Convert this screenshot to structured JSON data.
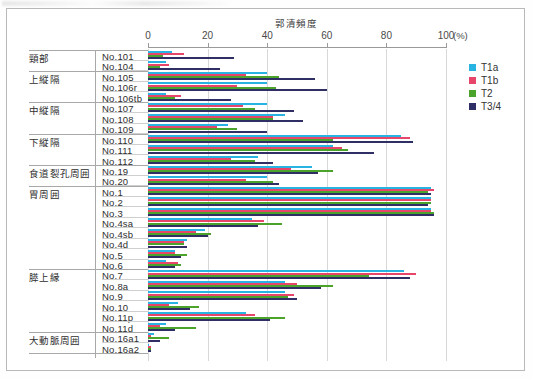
{
  "figure": {
    "axis_title": "郭清頻度",
    "percent_unit": "(%)",
    "tick_labels": [
      "0",
      "20",
      "40",
      "60",
      "80",
      "100"
    ],
    "tick_values": [
      0,
      20,
      40,
      60,
      80,
      100
    ]
  },
  "legend": {
    "position": "right",
    "entries": [
      {
        "label": "T1a",
        "color": "#29b3e3"
      },
      {
        "label": "T1b",
        "color": "#e8456b"
      },
      {
        "label": "T2",
        "color": "#4aa32a"
      },
      {
        "label": "T3/4",
        "color": "#2f2f66"
      }
    ]
  },
  "groups": [
    {
      "name": "頸部",
      "nodes": [
        "No.101",
        "No.104"
      ]
    },
    {
      "name": "上縦隔",
      "nodes": [
        "No.105",
        "No.106r",
        "No.106tb"
      ]
    },
    {
      "name": "中縦隔",
      "nodes": [
        "No.107",
        "No.108",
        "No.109"
      ]
    },
    {
      "name": "下縦隔",
      "nodes": [
        "No.110",
        "No.111",
        "No.112"
      ]
    },
    {
      "name": "食道裂孔周囲",
      "nodes": [
        "No.19",
        "No.20"
      ]
    },
    {
      "name": "胃周囲",
      "nodes": [
        "No.1",
        "No.2",
        "No.3",
        "No.4sa",
        "No.4sb",
        "No.4d",
        "No.5",
        "No.6"
      ]
    },
    {
      "name": "膵上縁",
      "nodes": [
        "No.7",
        "No.8a",
        "No.9",
        "No.10",
        "No.11p",
        "No.11d"
      ]
    },
    {
      "name": "大動脈周囲",
      "nodes": [
        "No.16a1",
        "No.16a2"
      ]
    }
  ],
  "chart_data": {
    "type": "bar",
    "orientation": "horizontal",
    "title": "郭清頻度",
    "xlabel": "郭清頻度 (%)",
    "ylabel": "",
    "xlim": [
      0,
      100
    ],
    "grid": true,
    "legend_position": "right",
    "categories": [
      "No.101",
      "No.104",
      "No.105",
      "No.106r",
      "No.106tb",
      "No.107",
      "No.108",
      "No.109",
      "No.110",
      "No.111",
      "No.112",
      "No.19",
      "No.20",
      "No.1",
      "No.2",
      "No.3",
      "No.4sa",
      "No.4sb",
      "No.4d",
      "No.5",
      "No.6",
      "No.7",
      "No.8a",
      "No.9",
      "No.10",
      "No.11p",
      "No.11d",
      "No.16a1",
      "No.16a2"
    ],
    "series": [
      {
        "name": "T1a",
        "color": "#29b3e3",
        "values": [
          8,
          6,
          40,
          40,
          6,
          40,
          46,
          27,
          85,
          62,
          37,
          55,
          40,
          95,
          95,
          95,
          35,
          19,
          13,
          9,
          6,
          86,
          46,
          46,
          10,
          33,
          6,
          2,
          0
        ]
      },
      {
        "name": "T1b",
        "color": "#e8456b",
        "values": [
          12,
          7,
          33,
          30,
          11,
          32,
          42,
          23,
          88,
          65,
          28,
          48,
          33,
          96,
          95,
          95,
          39,
          16,
          12,
          9,
          10,
          90,
          50,
          49,
          7,
          36,
          4,
          1,
          1
        ]
      },
      {
        "name": "T2",
        "color": "#4aa32a",
        "values": [
          5,
          4,
          44,
          43,
          9,
          36,
          42,
          30,
          62,
          67,
          36,
          62,
          42,
          94,
          95,
          96,
          45,
          21,
          12,
          13,
          11,
          74,
          62,
          47,
          17,
          46,
          16,
          7,
          1
        ]
      },
      {
        "name": "T3/4",
        "color": "#2f2f66",
        "values": [
          29,
          24,
          56,
          60,
          28,
          49,
          52,
          40,
          89,
          76,
          42,
          57,
          44,
          95,
          94,
          96,
          37,
          20,
          13,
          11,
          9,
          88,
          58,
          50,
          14,
          41,
          9,
          4,
          1
        ]
      }
    ]
  }
}
